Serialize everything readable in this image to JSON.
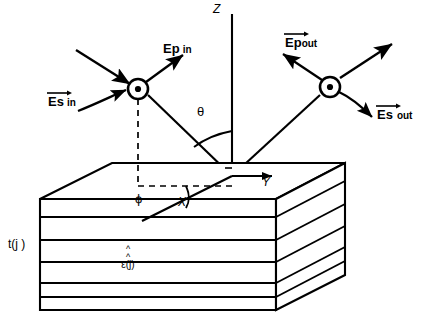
{
  "figure": {
    "type": "optical-reflection-multilayer-schematic",
    "axes": {
      "z": "Z",
      "x": "X",
      "y": "Y"
    },
    "angles": {
      "theta": "θ",
      "phi": "ϕ"
    },
    "incident": {
      "p_label": "Ep",
      "p_sub": "in",
      "s_label": "Es",
      "s_sub": "in",
      "marker": "circle-dot-out-of-page"
    },
    "reflected": {
      "p_label": "Ep",
      "p_sub": "out",
      "s_label": "Es",
      "s_sub": "out",
      "marker": "circle-dot-out-of-page"
    },
    "slab": {
      "thickness_label": "t(j )",
      "dielectric_label": "ε(j)",
      "dielectric_hat": "^",
      "layer_count": 6
    },
    "colors": {
      "stroke": "#000000",
      "background": "#ffffff"
    }
  }
}
